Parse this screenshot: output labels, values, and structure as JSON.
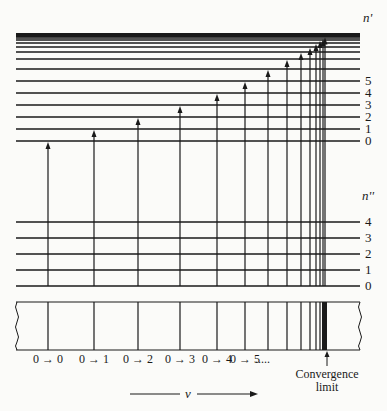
{
  "diagram": {
    "upper_state_label": "n'",
    "lower_state_label": "n''",
    "upper_levels": [
      {
        "label": "0",
        "y": 141
      },
      {
        "label": "1",
        "y": 129
      },
      {
        "label": "2",
        "y": 117
      },
      {
        "label": "3",
        "y": 105
      },
      {
        "label": "4",
        "y": 93
      },
      {
        "label": "5",
        "y": 81
      },
      {
        "label": "",
        "y": 69
      },
      {
        "label": "",
        "y": 59
      },
      {
        "label": "",
        "y": 52
      },
      {
        "label": "",
        "y": 47
      },
      {
        "label": "",
        "y": 43
      },
      {
        "label": "",
        "y": 40
      },
      {
        "label": "",
        "y": 38
      },
      {
        "label": "",
        "y": 36.5
      },
      {
        "label": "",
        "y": 35.5
      }
    ],
    "lower_levels": [
      {
        "label": "0",
        "y": 286
      },
      {
        "label": "1",
        "y": 270
      },
      {
        "label": "2",
        "y": 254
      },
      {
        "label": "3",
        "y": 238
      },
      {
        "label": "4",
        "y": 222
      }
    ],
    "transitions_x": [
      48,
      94,
      138,
      180,
      217,
      245,
      268,
      287,
      301,
      310,
      316,
      320,
      323,
      325
    ],
    "transition_labels": [
      {
        "text": "0 → 0",
        "x": 48
      },
      {
        "text": "0 → 1",
        "x": 94
      },
      {
        "text": "0 → 2",
        "x": 138
      },
      {
        "text": "0 → 3",
        "x": 180
      },
      {
        "text": "0 → 4",
        "x": 217
      },
      {
        "text": "0 → 5",
        "x": 245
      },
      {
        "text": ".....",
        "x": 270
      }
    ],
    "convergence_label_line1": "Convergence",
    "convergence_label_line2": "limit",
    "axis_label": "ν"
  }
}
